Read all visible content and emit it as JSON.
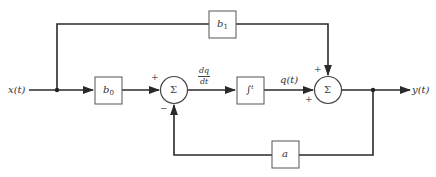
{
  "diagram": {
    "type": "block-diagram",
    "input": {
      "label": "x(t)"
    },
    "output": {
      "label": "y(t)"
    },
    "blocks": {
      "b0": {
        "label": "b",
        "subscript": "0"
      },
      "b1": {
        "label": "b",
        "subscript": "1"
      },
      "integrator": {
        "label": "∫",
        "superscript": "t"
      },
      "a": {
        "label": "a"
      }
    },
    "summers": {
      "sum1": {
        "symbol": "Σ",
        "sign_top_left": "+",
        "sign_bottom": "−"
      },
      "sum2": {
        "symbol": "Σ",
        "sign_top": "+",
        "sign_bottom_left": "+"
      }
    },
    "signals": {
      "dq_dt": {
        "numerator": "dq",
        "denominator": "dt"
      },
      "q": {
        "label": "q(t)"
      }
    },
    "connections": [
      "x(t) -> branch1",
      "branch1 -> b0",
      "branch1 -> b1",
      "b0 -> sum1 (+)",
      "sum1 -> integrator (dq/dt)",
      "integrator -> sum2 (+) (q(t))",
      "b1 -> sum2 (+)",
      "sum2 -> branch2",
      "branch2 -> y(t)",
      "branch2 -> a",
      "a -> sum1 (-)"
    ]
  }
}
